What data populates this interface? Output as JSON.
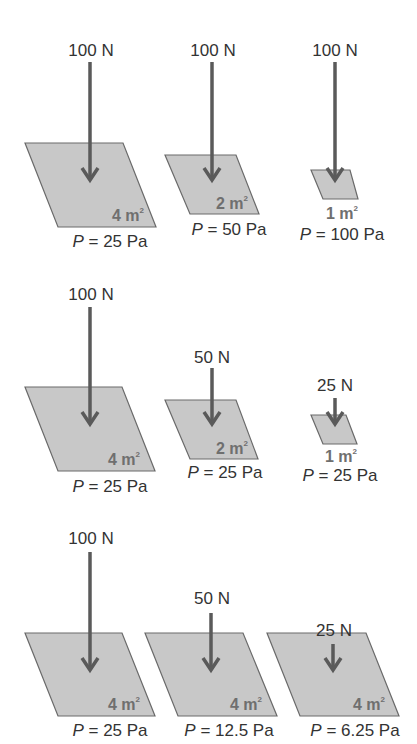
{
  "colors": {
    "plate_fill": "#c8c8c8",
    "plate_stroke": "#6a6a6a",
    "arrow": "#5a5a5a",
    "text": "#333333",
    "area_text": "#6f6f6f"
  },
  "rows": [
    {
      "description": "Same force, decreasing area",
      "items": [
        {
          "force": "100 N",
          "area_value": "4 m",
          "area_exp": "2",
          "pressure_symbol": "P",
          "pressure_value": " = 25 Pa"
        },
        {
          "force": "100 N",
          "area_value": "2 m",
          "area_exp": "2",
          "pressure_symbol": "P",
          "pressure_value": " = 50 Pa"
        },
        {
          "force": "100 N",
          "area_value": "1 m",
          "area_exp": "2",
          "pressure_symbol": "P",
          "pressure_value": " = 100 Pa"
        }
      ]
    },
    {
      "description": "Force and area decrease proportionally",
      "items": [
        {
          "force": "100 N",
          "area_value": "4 m",
          "area_exp": "2",
          "pressure_symbol": "P",
          "pressure_value": " = 25 Pa"
        },
        {
          "force": "50 N",
          "area_value": "2 m",
          "area_exp": "2",
          "pressure_symbol": "P",
          "pressure_value": " = 25 Pa"
        },
        {
          "force": "25 N",
          "area_value": "1 m",
          "area_exp": "2",
          "pressure_symbol": "P",
          "pressure_value": " = 25 Pa"
        }
      ]
    },
    {
      "description": "Same area, decreasing force",
      "items": [
        {
          "force": "100 N",
          "area_value": "4 m",
          "area_exp": "2",
          "pressure_symbol": "P",
          "pressure_value": " = 25 Pa"
        },
        {
          "force": "50 N",
          "area_value": "4 m",
          "area_exp": "2",
          "pressure_symbol": "P",
          "pressure_value": " = 12.5 Pa"
        },
        {
          "force": "25 N",
          "area_value": "4 m",
          "area_exp": "2",
          "pressure_symbol": "P",
          "pressure_value": " = 6.25 Pa"
        }
      ]
    }
  ]
}
